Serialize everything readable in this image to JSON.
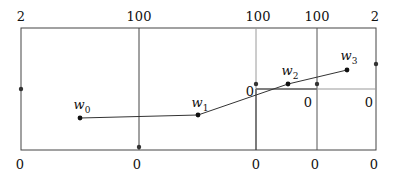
{
  "diagram": {
    "top_labels": [
      {
        "text": "2",
        "x": 21
      },
      {
        "text": "100",
        "x": 139
      },
      {
        "text": "100",
        "x": 256
      },
      {
        "text": "100",
        "x": 317
      },
      {
        "text": "2",
        "x": 376
      }
    ],
    "bottom_labels": [
      {
        "text": "0",
        "x": 21
      },
      {
        "text": "0",
        "x": 139
      },
      {
        "text": "0",
        "x": 256
      },
      {
        "text": "0",
        "x": 317
      },
      {
        "text": "0",
        "x": 376
      }
    ],
    "inner_labels": [
      {
        "text": "0",
        "x": 250,
        "y": 86
      },
      {
        "text": "0",
        "x": 308,
        "y": 98
      },
      {
        "text": "0",
        "x": 369,
        "y": 98
      }
    ],
    "points": [
      {
        "name": "w",
        "sub": "0",
        "x": 80,
        "y": 118
      },
      {
        "name": "w",
        "sub": "1",
        "x": 198,
        "y": 115
      },
      {
        "name": "w",
        "sub": "2",
        "x": 288,
        "y": 84
      },
      {
        "name": "w",
        "sub": "3",
        "x": 347,
        "y": 70
      }
    ],
    "labels": {
      "w0": "w",
      "w0_sub": "0",
      "w1": "w",
      "w1_sub": "1",
      "w2": "w",
      "w2_sub": "2",
      "w3": "w",
      "w3_sub": "3",
      "top": [
        "2",
        "100",
        "100",
        "100",
        "2"
      ],
      "bottom": [
        "0",
        "0",
        "0",
        "0",
        "0"
      ],
      "inner": [
        "0",
        "0",
        "0"
      ]
    },
    "colors": {
      "line": "#333333",
      "light_line": "#9a9a9a",
      "dot": "#111111"
    }
  }
}
